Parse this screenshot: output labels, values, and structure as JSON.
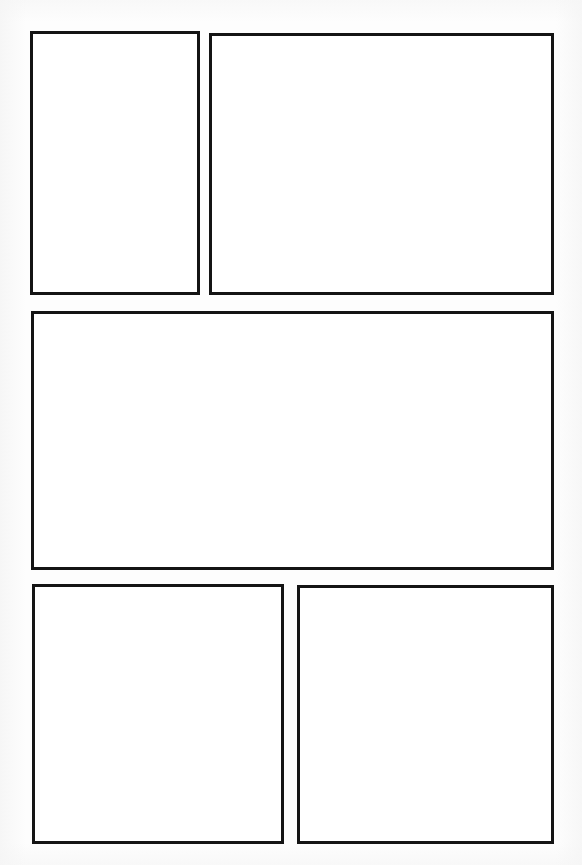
{
  "page": {
    "kind": "blank-comic-page-template",
    "title": "",
    "width": 582,
    "height": 865,
    "background_color": "#fdfdfd",
    "panel_fill_color": "#ffffff",
    "panel_border_color": "#141414",
    "panel_border_width_px": 3,
    "row_count": 3,
    "panel_count": 5,
    "caption": ""
  },
  "rows": [
    {
      "index": 1,
      "label": "",
      "panel_ids": [
        "panel-1",
        "panel-2"
      ]
    },
    {
      "index": 2,
      "label": "",
      "panel_ids": [
        "panel-3"
      ]
    },
    {
      "index": 3,
      "label": "",
      "panel_ids": [
        "panel-4",
        "panel-5"
      ]
    }
  ],
  "panels": [
    {
      "id": "panel-1",
      "row": 1,
      "position_in_row": 1,
      "shape": "tall-portrait",
      "content": "",
      "x": 30,
      "y": 31,
      "width": 170,
      "height": 264
    },
    {
      "id": "panel-2",
      "row": 1,
      "position_in_row": 2,
      "shape": "wide-landscape",
      "content": "",
      "x": 209,
      "y": 33,
      "width": 345,
      "height": 262
    },
    {
      "id": "panel-3",
      "row": 2,
      "position_in_row": 1,
      "shape": "full-width-landscape",
      "content": "",
      "x": 31,
      "y": 311,
      "width": 523,
      "height": 259
    },
    {
      "id": "panel-4",
      "row": 3,
      "position_in_row": 1,
      "shape": "square",
      "content": "",
      "x": 32,
      "y": 584,
      "width": 252,
      "height": 260
    },
    {
      "id": "panel-5",
      "row": 3,
      "position_in_row": 2,
      "shape": "square",
      "content": "",
      "x": 297,
      "y": 585,
      "width": 257,
      "height": 259
    }
  ]
}
